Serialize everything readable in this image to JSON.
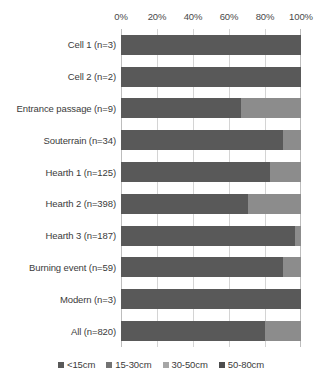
{
  "chart_data": {
    "type": "bar",
    "orientation": "horizontal",
    "stacked": true,
    "normalized_percent": true,
    "title": "",
    "subtitle": "",
    "xlabel": "",
    "ylabel": "",
    "xlim": [
      0,
      100
    ],
    "grid": true,
    "legend_position": "bottom",
    "xticks": [
      "0%",
      "20%",
      "40%",
      "60%",
      "80%",
      "100%"
    ],
    "xtick_values": [
      0,
      20,
      40,
      60,
      80,
      100
    ],
    "categories": [
      "Cell 1 (n=3)",
      "Cell 2 (n=2)",
      "Entrance passage (n=9)",
      "Souterrain (n=34)",
      "Hearth 1 (n=125)",
      "Hearth 2 (n=398)",
      "Hearth 3 (n=187)",
      "Burning event (n=59)",
      "Modern (n=3)",
      "All (n=820)"
    ],
    "series": [
      {
        "name": "<15cm",
        "color": "#595959",
        "values": [
          100,
          100,
          66.7,
          90,
          82.5,
          70.5,
          96.5,
          90,
          100,
          80
        ]
      },
      {
        "name": "15-30cm",
        "color": "#8c8c8c",
        "values": [
          0,
          0,
          33.3,
          10,
          17.5,
          29.5,
          3.5,
          10,
          0,
          20
        ]
      },
      {
        "name": "30-50cm",
        "color": "#a6a6a6",
        "values": [
          0,
          0,
          0,
          0,
          0,
          0,
          0,
          0,
          0,
          0
        ]
      },
      {
        "name": "50-80cm",
        "color": "#404040",
        "values": [
          0,
          0,
          0,
          0,
          0,
          0,
          0,
          0,
          0,
          0
        ]
      }
    ]
  },
  "legend": {
    "items": [
      {
        "label": "<15cm",
        "color": "#595959",
        "marker": "square-swatch-icon"
      },
      {
        "label": "15-30cm",
        "color": "#737373",
        "marker": "square-swatch-icon"
      },
      {
        "label": "30-50cm",
        "color": "#a6a6a6",
        "marker": "square-swatch-icon"
      },
      {
        "label": "50-80cm",
        "color": "#4d4d4d",
        "marker": "square-swatch-icon"
      }
    ]
  },
  "colors": {
    "gridline": "#d4d4d4",
    "axis": "#bdbdbd",
    "text": "#3b3b3b",
    "background": "#ffffff"
  }
}
